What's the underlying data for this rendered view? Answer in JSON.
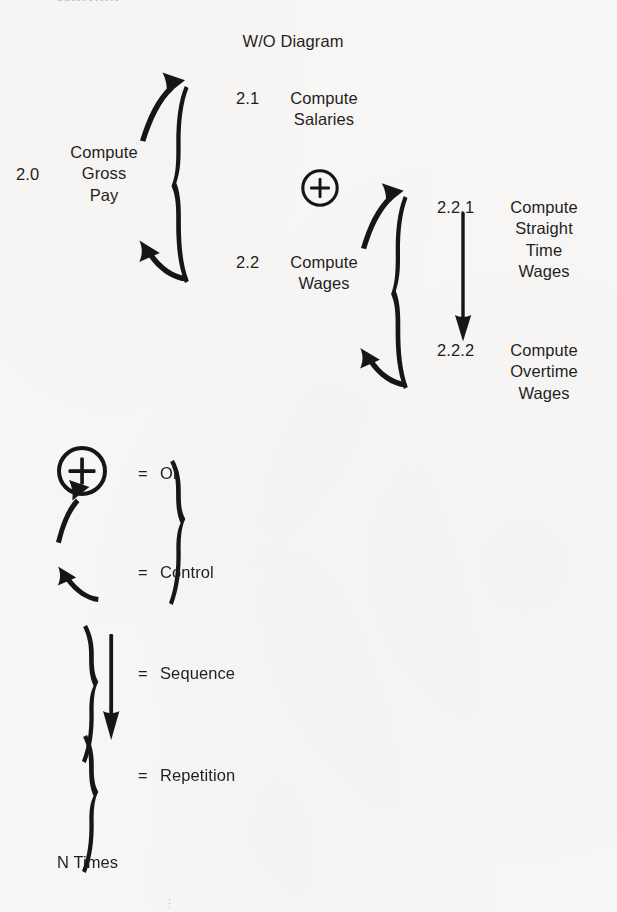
{
  "document": {
    "title": "W/O Diagram",
    "background_color": "#f8f7f5",
    "ink_color": "#1c1c1c",
    "top_cutoff_fragment": "Warnier"
  },
  "diagram": {
    "root": {
      "number": "2.0",
      "label_lines": [
        "Compute",
        "Gross",
        "Pay"
      ]
    },
    "level1": {
      "operator": "or-plus",
      "operator_symbol": "+",
      "children": [
        {
          "number": "2.1",
          "label_lines": [
            "Compute",
            "Salaries"
          ]
        },
        {
          "number": "2.2",
          "label_lines": [
            "Compute",
            "Wages"
          ]
        }
      ]
    },
    "level2": {
      "parent_number": "2.2",
      "relation": "sequence",
      "children": [
        {
          "number": "2.2.1",
          "label_lines": [
            "Compute",
            "Straight",
            "Time",
            "Wages"
          ]
        },
        {
          "number": "2.2.2",
          "label_lines": [
            "Compute",
            "Overtime",
            "Wages"
          ]
        }
      ]
    }
  },
  "legend": {
    "rows": [
      {
        "key": "or",
        "symbol": "circled-plus-symbol",
        "equals": "=",
        "label": "Or"
      },
      {
        "key": "control",
        "symbol": "control-brace-symbol",
        "equals": "=",
        "label": "Control"
      },
      {
        "key": "sequence",
        "symbol": "sequence-brace-symbol",
        "equals": "=",
        "label": "Sequence"
      },
      {
        "key": "repetition",
        "symbol": "repetition-brace-symbol",
        "equals": "=",
        "label": "Repetition"
      }
    ],
    "footnote": "N Times"
  }
}
